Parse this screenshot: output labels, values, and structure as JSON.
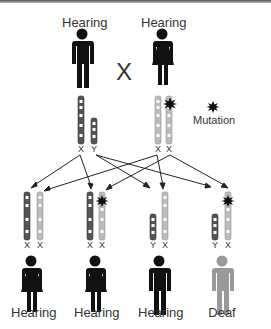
{
  "diagram": {
    "parents": {
      "father": {
        "label": "Hearing",
        "chromosomes": [
          "X",
          "Y"
        ]
      },
      "cross_symbol": "X",
      "mother": {
        "label": "Hearing",
        "chromosomes": [
          "X",
          "X"
        ]
      }
    },
    "legend": {
      "icon": "mutation-burst-icon",
      "label": "Mutation"
    },
    "children": [
      {
        "sex": "female",
        "label": "Hearing",
        "chromosomes": [
          "X",
          "X"
        ],
        "mutation": false
      },
      {
        "sex": "female",
        "label": "Hearing",
        "chromosomes": [
          "X",
          "X"
        ],
        "mutation": true
      },
      {
        "sex": "male",
        "label": "Hearing",
        "chromosomes": [
          "Y",
          "X"
        ],
        "mutation": false
      },
      {
        "sex": "male",
        "label": "Deaf",
        "chromosomes": [
          "Y",
          "X"
        ],
        "mutation": true
      }
    ],
    "colors": {
      "father_chromosome": "#555555",
      "mother_chromosome": "#bbbbbb",
      "hearing_figure": "#111111",
      "deaf_figure": "#999999",
      "mutation": "#111111"
    }
  }
}
